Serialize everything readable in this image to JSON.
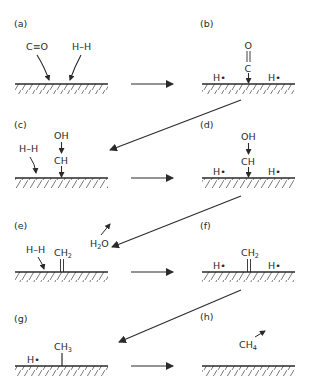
{
  "diagram": {
    "panels": [
      {
        "id": "a",
        "label": "(a)",
        "species": [
          "C≡O",
          "H–H"
        ]
      },
      {
        "id": "b",
        "label": "(b)",
        "species": [
          "O",
          "C",
          "H•",
          "H•"
        ]
      },
      {
        "id": "c",
        "label": "(c)",
        "species": [
          "H–H",
          "OH",
          "CH"
        ]
      },
      {
        "id": "d",
        "label": "(d)",
        "species": [
          "OH",
          "CH",
          "H•",
          "H•"
        ]
      },
      {
        "id": "e",
        "label": "(e)",
        "species": [
          "H–H",
          "CH2",
          "H2O"
        ]
      },
      {
        "id": "f",
        "label": "(f)",
        "species": [
          "CH2",
          "H•",
          "H•"
        ]
      },
      {
        "id": "g",
        "label": "(g)",
        "species": [
          "H•",
          "CH3"
        ]
      },
      {
        "id": "h",
        "label": "(h)",
        "species": [
          "CH4"
        ]
      }
    ],
    "text": {
      "co": "C≡O",
      "hh": "H–H",
      "o": "O",
      "c": "C",
      "hdot": "H•",
      "oh": "OH",
      "ch": "CH",
      "ch2_main": "CH",
      "ch2_sub": "2",
      "ch3_main": "CH",
      "ch3_sub": "3",
      "h2o_h": "H",
      "h2o_sub": "2",
      "h2o_o": "O",
      "ch4_main": "CH",
      "ch4_sub": "4"
    },
    "colors": {
      "ink": "#2a2a2a",
      "background": "#ffffff"
    }
  }
}
